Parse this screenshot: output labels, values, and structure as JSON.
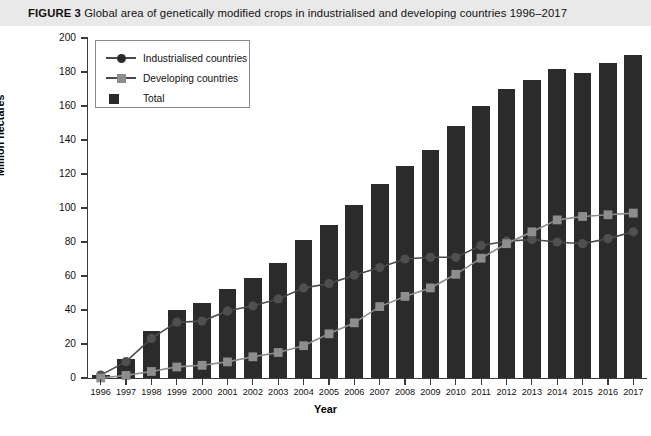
{
  "caption": {
    "figure_number": "FIGURE 3",
    "text": "Global area of genetically modified crops in industrialised and developing countries 1996–2017"
  },
  "legend": {
    "position": "top-left-inside",
    "items": [
      {
        "label": "Industrialised countries",
        "marker": "circle-line",
        "color": "#2b2b2b"
      },
      {
        "label": "Developing countries",
        "marker": "square-line",
        "color": "#8d8d8d"
      },
      {
        "label": "Total",
        "marker": "filled-square",
        "color": "#2b2b2b"
      }
    ]
  },
  "axes": {
    "y_title": "Million hectares",
    "x_title": "Year",
    "y_ticks": [
      "0",
      "20",
      "40",
      "60",
      "80",
      "100",
      "120",
      "140",
      "160",
      "180",
      "200"
    ]
  },
  "chart_data": {
    "type": "bar",
    "title": "Global area of genetically modified crops in industrialised and developing countries 1996–2017",
    "xlabel": "Year",
    "ylabel": "Million hectares",
    "ylim": [
      0,
      200
    ],
    "ytick_step": 20,
    "grid": false,
    "legend_position": "upper left",
    "categories": [
      "1996",
      "1997",
      "1998",
      "1999",
      "2000",
      "2001",
      "2002",
      "2003",
      "2004",
      "2005",
      "2006",
      "2007",
      "2008",
      "2009",
      "2010",
      "2011",
      "2012",
      "2013",
      "2014",
      "2015",
      "2016",
      "2017"
    ],
    "series": [
      {
        "name": "Total",
        "render": "bar",
        "color": "#2b2b2b",
        "values": [
          1.7,
          11.0,
          27.8,
          39.9,
          44.2,
          52.6,
          58.7,
          67.7,
          81.0,
          90.0,
          102.0,
          114.0,
          125.0,
          134.0,
          148.0,
          160.0,
          170.1,
          175.2,
          181.5,
          179.7,
          185.1,
          189.8
        ]
      },
      {
        "name": "Industrialised countries",
        "render": "line-marker-circle",
        "color": "#4a4a4a",
        "values": [
          1.7,
          9.6,
          23.3,
          32.8,
          33.5,
          39.5,
          42.5,
          46.5,
          53.0,
          55.5,
          60.5,
          65.0,
          70.0,
          71.0,
          71.0,
          78.0,
          80.5,
          81.5,
          80.0,
          79.0,
          82.0,
          86.0
        ]
      },
      {
        "name": "Developing countries",
        "render": "line-marker-square",
        "color": "#8d8d8d",
        "values": [
          0.0,
          1.5,
          3.8,
          6.5,
          7.5,
          9.5,
          12.5,
          15.0,
          19.0,
          26.0,
          32.5,
          42.0,
          48.0,
          53.0,
          61.0,
          70.5,
          79.0,
          86.0,
          93.0,
          95.0,
          96.0,
          97.0
        ]
      }
    ]
  }
}
